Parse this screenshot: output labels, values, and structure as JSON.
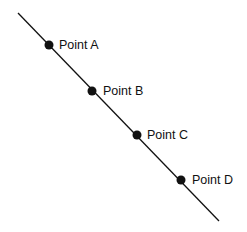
{
  "diagram": {
    "line": {
      "x1": 18,
      "y1": 13,
      "x2": 219,
      "y2": 221,
      "color": "#111111",
      "width": 1.3
    },
    "points": [
      {
        "label": "Point A",
        "x": 49,
        "y": 45
      },
      {
        "label": "Point B",
        "x": 92,
        "y": 91
      },
      {
        "label": "Point C",
        "x": 137,
        "y": 135
      },
      {
        "label": "Point D",
        "x": 181,
        "y": 180
      }
    ],
    "point_color": "#111111",
    "point_radius": 4.5
  }
}
